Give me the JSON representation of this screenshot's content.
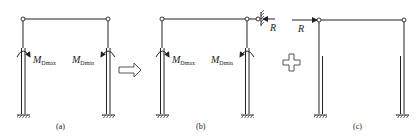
{
  "figure": {
    "panels": [
      {
        "id": "a",
        "caption": "(a)",
        "moment_left": {
          "symbol": "M",
          "sub": "Dmax"
        },
        "moment_right": {
          "symbol": "M",
          "sub": "Dmin"
        }
      },
      {
        "id": "b",
        "caption": "(b)",
        "moment_left": {
          "symbol": "M",
          "sub": "Dmax"
        },
        "moment_right": {
          "symbol": "M",
          "sub": "Dmin"
        },
        "reaction_label": "R"
      },
      {
        "id": "c",
        "caption": "(c)",
        "force_label": "R"
      }
    ],
    "operators": {
      "arrow": "⇨",
      "plus": "+"
    }
  }
}
